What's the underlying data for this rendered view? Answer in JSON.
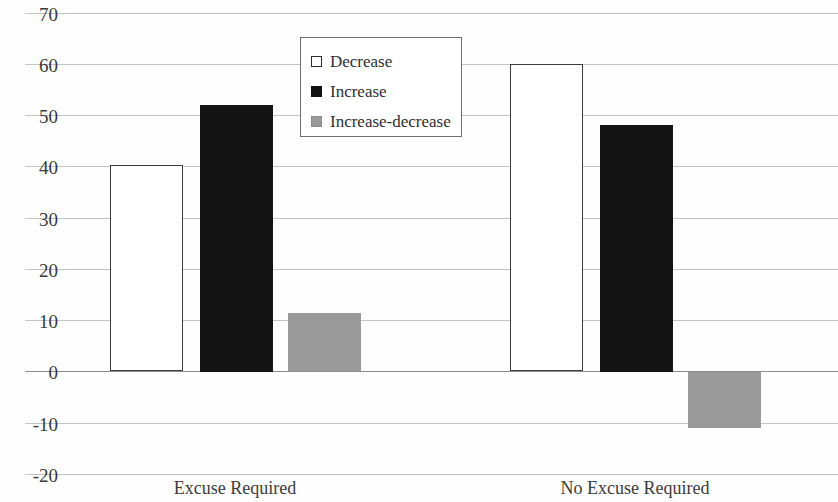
{
  "chart_data": {
    "type": "bar",
    "title": "",
    "subtitle": "",
    "xlabel": "",
    "ylabel": "",
    "categories": [
      "Excuse Required",
      "No Excuse Required"
    ],
    "ylim": [
      -20,
      70
    ],
    "ytick_values": [
      70,
      60,
      50,
      40,
      30,
      20,
      10,
      0,
      -10,
      -20
    ],
    "ytick_labels": [
      "70",
      "60",
      "50",
      "40",
      "30",
      "20",
      "10",
      "0",
      "-10",
      "-20"
    ],
    "grid": true,
    "legend_position": "upper-center",
    "series": [
      {
        "name": "Decrease",
        "color": "#ffffff",
        "edge_color": "#3c3c3c",
        "values": [
          40.3,
          60.0
        ]
      },
      {
        "name": "Increase",
        "color": "#141414",
        "edge_color": "#141414",
        "values": [
          52.0,
          48.2
        ]
      },
      {
        "name": "Increase-decrease",
        "color": "#9a9a9a",
        "edge_color": "#9a9a9a",
        "values": [
          11.5,
          -11.0
        ]
      }
    ]
  },
  "legend": {
    "items": [
      {
        "label": "Decrease",
        "swatch": "decrease"
      },
      {
        "label": "Increase",
        "swatch": "increase"
      },
      {
        "label": "Increase-decrease",
        "swatch": "increase-decrease"
      }
    ]
  },
  "axis": {
    "y_ticks": [
      "70",
      "60",
      "50",
      "40",
      "30",
      "20",
      "10",
      "0",
      "-10",
      "-20"
    ],
    "x_ticks": [
      "Excuse Required",
      "No Excuse Required"
    ]
  }
}
